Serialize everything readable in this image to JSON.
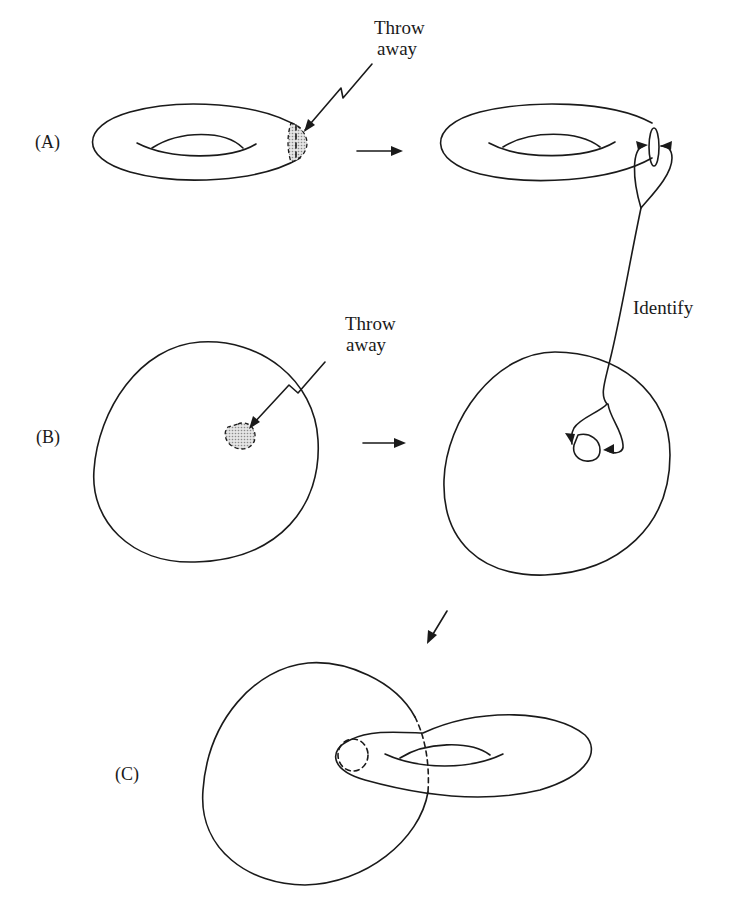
{
  "figure": {
    "panels": [
      {
        "id": "A",
        "label": "(A)",
        "throw_away_label": [
          "Throw",
          "away"
        ],
        "left_shape": "torus with shaded disk on right edge",
        "right_shape": "torus with boundary circle (hole)"
      },
      {
        "id": "B",
        "label": "(B)",
        "throw_away_label": [
          "Throw",
          "away"
        ],
        "left_shape": "sphere with shaded disk in center",
        "right_shape": "sphere with boundary circle (hole)"
      },
      {
        "id": "C",
        "label": "(C)",
        "result_shape": "sphere and torus joined through a hole"
      }
    ],
    "identify_label": "Identify",
    "arrows": [
      "right-arrow-A",
      "right-arrow-B",
      "down-left-arrow-to-C"
    ],
    "colors": {
      "ink": "#1a1a1a",
      "shading": "#9a9a9a",
      "background": "#ffffff"
    }
  }
}
